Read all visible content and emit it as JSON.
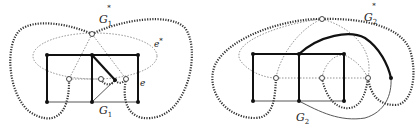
{
  "figure": {
    "left": {
      "graph_label": "G",
      "graph_sub": "1",
      "dual_label": "G",
      "dual_sub": "1",
      "dual_sup": "*",
      "edge_label": "e",
      "dual_edge_label": "e",
      "dual_edge_sup": "*"
    },
    "right": {
      "graph_label": "G",
      "graph_sub": "2",
      "dual_label": "G",
      "dual_sub": "2",
      "dual_sup": "*"
    },
    "colors": {
      "primal_edge": "#111111",
      "dual_edge": "#333333",
      "thin_dotted": "#777777",
      "background": "#ffffff"
    }
  }
}
